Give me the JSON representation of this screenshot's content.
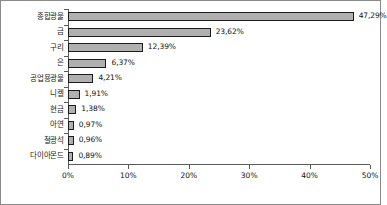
{
  "chart_data": {
    "type": "bar",
    "orientation": "horizontal",
    "title": "",
    "subtitle": "",
    "xlabel": "",
    "ylabel": "",
    "xlim": [
      0,
      50
    ],
    "grid": false,
    "legend": null,
    "legend_position": "none",
    "bar_fill_color": "#b0b0b0",
    "bar_border_color": "#1c1c1c",
    "axis_color": "#5a5a5a",
    "frame_color": "#8a8a8a",
    "value_label_suffix": "%",
    "categories": [
      "종합광물",
      "금",
      "구리",
      "은",
      "공업용광물",
      "니켈",
      "현금",
      "아연",
      "철광석",
      "다이아몬드"
    ],
    "values": [
      47.29,
      23.62,
      12.39,
      6.37,
      4.21,
      1.91,
      1.38,
      0.97,
      0.96,
      0.89
    ],
    "value_labels": [
      "47,29%",
      "23,62%",
      "12,39%",
      "6,37%",
      "4,21%",
      "1,91%",
      "1,38%",
      "0,97%",
      "0,96%",
      "0,89%"
    ],
    "xticks": [
      0,
      10,
      20,
      30,
      40,
      50
    ],
    "xtick_labels": [
      "0%",
      "10%",
      "20%",
      "30%",
      "40%",
      "50%"
    ]
  }
}
